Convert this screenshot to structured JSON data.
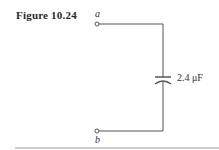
{
  "figure": {
    "label": "Figure 10.24",
    "terminals": {
      "top": "a",
      "bottom": "b"
    },
    "capacitor": {
      "value_label": "2.4 μF"
    }
  }
}
